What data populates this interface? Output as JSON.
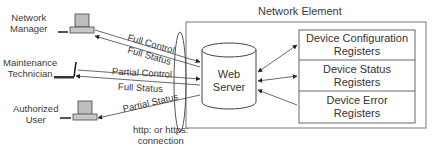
{
  "container": {
    "title": "Network Element"
  },
  "actors": [
    {
      "id": "network-manager",
      "label_line1": "Network",
      "label_line2": "Manager",
      "icon": "desktop-computer-icon"
    },
    {
      "id": "maintenance-technician",
      "label_line1": "Maintenance",
      "label_line2": "Technician",
      "icon": "laptop-icon"
    },
    {
      "id": "authorized-user",
      "label_line1": "Authorized",
      "label_line2": "User",
      "icon": "desktop-computer-icon"
    }
  ],
  "server": {
    "line1": "Web",
    "line2": "Server",
    "icon": "database-cylinder-icon"
  },
  "registers": [
    {
      "line1": "Device Configuration",
      "line2": "Registers",
      "arrow": "bidirectional"
    },
    {
      "line1": "Device Status",
      "line2": "Registers",
      "arrow": "bidirectional"
    },
    {
      "line1": "Device Error",
      "line2": "Registers",
      "arrow": "to-server"
    }
  ],
  "links": [
    {
      "label": "Full Control",
      "from": "Network Manager",
      "to": "Web Server"
    },
    {
      "label": "Full Status",
      "from": "Web Server",
      "to": "Network Manager"
    },
    {
      "label": "Partial Control",
      "from": "Maintenance Technician",
      "to": "Web Server"
    },
    {
      "label": "Full Status",
      "from": "Web Server",
      "to": "Maintenance Technician"
    },
    {
      "label": "Partial Status",
      "from": "Web Server",
      "to": "Authorized User"
    }
  ],
  "connection": {
    "line1": "http: or https:",
    "line2": "connection"
  }
}
